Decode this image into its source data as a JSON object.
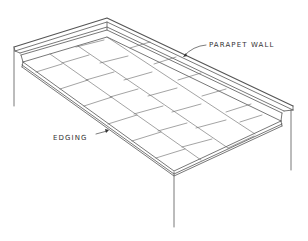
{
  "figure": {
    "type": "isometric roof drawing",
    "line_color": "#555555",
    "background": "#ffffff",
    "labels": {
      "parapet_wall": "PARAPET WALL",
      "edging": "EDGING"
    }
  }
}
